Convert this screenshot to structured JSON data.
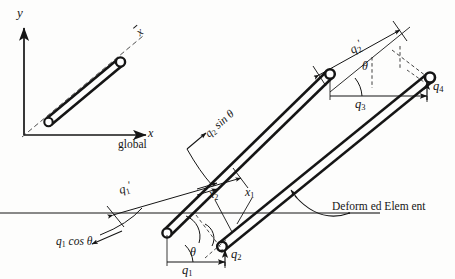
{
  "figure": {
    "background_color": "#fdfdfc",
    "line_color": "#151515",
    "dashed_color": "#2b2b2b"
  },
  "axes": {
    "y_label": "y",
    "x_label": "x",
    "frame_label": "global",
    "local_axis_label": "x"
  },
  "labels": {
    "q1_prime": "q",
    "q1_prime_sub": "1",
    "q2_prime": "q",
    "q2_prime_sub": "2",
    "q1": "q",
    "q1_sub": "1",
    "q2": "q",
    "q2_sub": "2",
    "q3": "q",
    "q3_sub": "3",
    "q4": "q",
    "q4_sub": "4",
    "x1": "x",
    "x1_sub": "1",
    "x2": "x",
    "x2_sub": "2",
    "theta_left": "θ",
    "theta_right": "θ",
    "q1_cos_theta": "cos θ",
    "q1_cos_theta_q": "q",
    "q1_cos_theta_sub": "1",
    "q2_sin_theta": "sin θ",
    "q2_sin_theta_q": "q",
    "q2_sin_theta_sub": "2",
    "deformed_element": "Deform ed Elem ent"
  },
  "elements": [
    {
      "name": "undeformed-element-inset",
      "description": "small inclined bar with nodes at both ends near global origin"
    },
    {
      "name": "original-element",
      "description": "upper long inclined bar, original position"
    },
    {
      "name": "deformed-element",
      "description": "lower long inclined bar, displaced position"
    }
  ]
}
